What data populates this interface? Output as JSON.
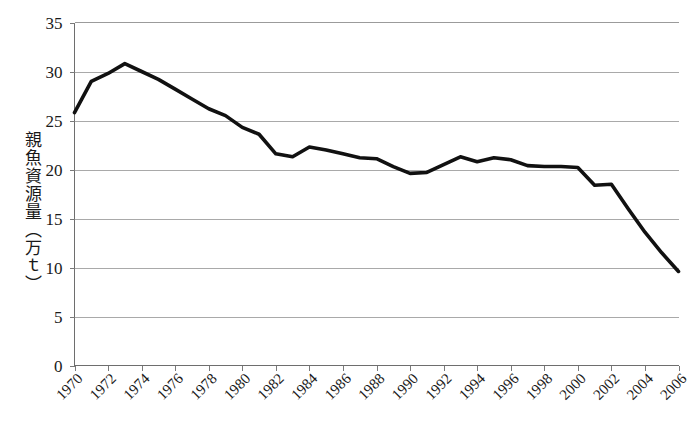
{
  "chart_data": {
    "type": "line",
    "title": "",
    "xlabel": "",
    "ylabel": "親魚資源量（万ｔ）",
    "ylim": [
      0,
      35
    ],
    "xlim": [
      1970,
      2006
    ],
    "grid": true,
    "legend": false,
    "y_ticks": [
      0,
      5,
      10,
      15,
      20,
      25,
      30,
      35
    ],
    "x_tick_labels": [
      "1970",
      "1972",
      "1974",
      "1976",
      "1978",
      "1980",
      "1982",
      "1984",
      "1986",
      "1988",
      "1990",
      "1992",
      "1994",
      "1996",
      "1998",
      "2000",
      "2002",
      "2004",
      "2006"
    ],
    "x_tick_rotation": 45,
    "series": [
      {
        "name": "親魚資源量",
        "color": "#111111",
        "x": [
          1970,
          1971,
          1972,
          1973,
          1974,
          1975,
          1976,
          1977,
          1978,
          1979,
          1980,
          1981,
          1982,
          1983,
          1984,
          1985,
          1986,
          1987,
          1988,
          1989,
          1990,
          1991,
          1992,
          1993,
          1994,
          1995,
          1996,
          1997,
          1998,
          1999,
          2000,
          2001,
          2002,
          2003,
          2004,
          2005,
          2006
        ],
        "values": [
          25.8,
          29.0,
          29.8,
          30.8,
          30.0,
          29.2,
          28.2,
          27.2,
          26.2,
          25.5,
          24.3,
          23.6,
          21.6,
          21.3,
          22.3,
          22.0,
          21.6,
          21.2,
          21.1,
          20.3,
          19.6,
          19.7,
          20.5,
          21.3,
          20.8,
          21.2,
          21.0,
          20.4,
          20.3,
          20.3,
          20.2,
          18.4,
          18.5,
          16.0,
          13.6,
          11.5,
          9.6
        ]
      }
    ]
  },
  "axis": {
    "y_title": "親魚資源量（万ｔ）"
  }
}
